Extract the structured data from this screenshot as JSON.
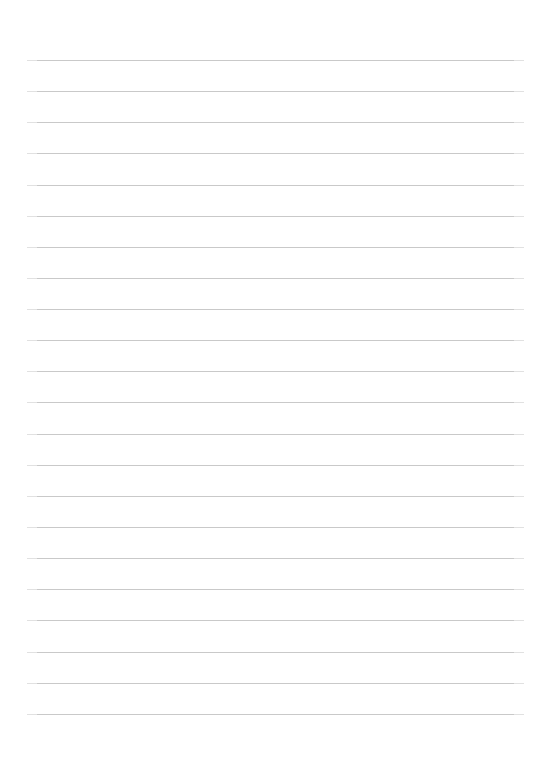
{
  "document": {
    "kind": "lined-paper-sheet",
    "title": "",
    "body_text": "",
    "page_width": 534,
    "page_height": 778,
    "background_color": "#ffffff"
  },
  "ruling": {
    "line_color": "#c9c9c9",
    "line_thickness_px": 1,
    "line_count": 22,
    "first_line_y": 60,
    "line_spacing_px": 31.15,
    "left_margin_x": 27,
    "right_margin_x": 524,
    "line_length_px": 497,
    "lines": [
      {
        "index": 1,
        "y": 60,
        "content": ""
      },
      {
        "index": 2,
        "y": 91,
        "content": ""
      },
      {
        "index": 3,
        "y": 122,
        "content": ""
      },
      {
        "index": 4,
        "y": 153,
        "content": ""
      },
      {
        "index": 5,
        "y": 185,
        "content": ""
      },
      {
        "index": 6,
        "y": 216,
        "content": ""
      },
      {
        "index": 7,
        "y": 247,
        "content": ""
      },
      {
        "index": 8,
        "y": 278,
        "content": ""
      },
      {
        "index": 9,
        "y": 309,
        "content": ""
      },
      {
        "index": 10,
        "y": 340,
        "content": ""
      },
      {
        "index": 11,
        "y": 371,
        "content": ""
      },
      {
        "index": 12,
        "y": 402,
        "content": ""
      },
      {
        "index": 13,
        "y": 434,
        "content": ""
      },
      {
        "index": 14,
        "y": 465,
        "content": ""
      },
      {
        "index": 15,
        "y": 496,
        "content": ""
      },
      {
        "index": 16,
        "y": 527,
        "content": ""
      },
      {
        "index": 17,
        "y": 558,
        "content": ""
      },
      {
        "index": 18,
        "y": 589,
        "content": ""
      },
      {
        "index": 19,
        "y": 620,
        "content": ""
      },
      {
        "index": 20,
        "y": 652,
        "content": ""
      },
      {
        "index": 21,
        "y": 683,
        "content": ""
      },
      {
        "index": 22,
        "y": 714,
        "content": ""
      }
    ]
  },
  "margins": {
    "top_blank_px": 60,
    "bottom_blank_px": 64,
    "left_blank_px": 27,
    "right_blank_px": 10
  }
}
